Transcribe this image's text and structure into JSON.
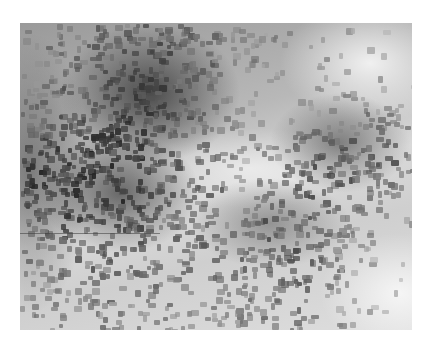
{
  "image": {
    "description": "Grayscale micrograph of a densely speckled surface",
    "left": 20,
    "top": 23,
    "width": 392,
    "height": 307,
    "background": "#ffffff",
    "colors": {
      "dark": "#2a2a2a",
      "mid": "#8c8c8c",
      "light": "#f2f2f2"
    },
    "dark_regions": [
      {
        "cx": 130,
        "cy": 70,
        "r": 90
      },
      {
        "cx": 100,
        "cy": 170,
        "r": 80
      },
      {
        "cx": 320,
        "cy": 120,
        "r": 70
      },
      {
        "cx": 250,
        "cy": 200,
        "r": 80
      },
      {
        "cx": 10,
        "cy": 150,
        "r": 60
      }
    ],
    "light_regions": [
      {
        "cx": 350,
        "cy": 40,
        "r": 90
      },
      {
        "cx": 230,
        "cy": 145,
        "r": 110
      },
      {
        "cx": 380,
        "cy": 270,
        "r": 80
      }
    ],
    "scanline_y": 210,
    "speckle_count": 1400,
    "speckle_seed": 7
  }
}
